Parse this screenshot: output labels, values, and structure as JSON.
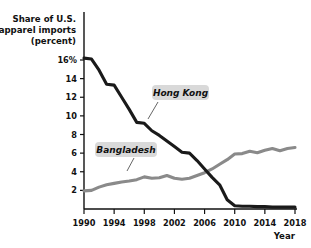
{
  "chart_data": {
    "type": "line",
    "title": "Share of U.S. apparel imports (percent)",
    "title_lines": [
      "Share of U.S.",
      "apparel imports",
      "(percent)"
    ],
    "xlabel": "Year",
    "ylabel": "Share of U.S. apparel imports (percent)",
    "xlim": [
      1990,
      2018
    ],
    "ylim": [
      0,
      16.8
    ],
    "grid": false,
    "legend_position": "inline-annotations",
    "x_ticks": [
      "1990",
      "1994",
      "1998",
      "2002",
      "2006",
      "2010",
      "2014",
      "2018"
    ],
    "x_tick_values": [
      1990,
      1994,
      1998,
      2002,
      2006,
      2010,
      2014,
      2018
    ],
    "y_ticks": [
      "2",
      "4",
      "6",
      "8",
      "10",
      "12",
      "14",
      "16%"
    ],
    "y_tick_values": [
      2,
      4,
      6,
      8,
      10,
      12,
      14,
      16
    ],
    "x": [
      1990,
      1991,
      1992,
      1993,
      1994,
      1995,
      1996,
      1997,
      1998,
      1999,
      2000,
      2001,
      2002,
      2003,
      2004,
      2005,
      2006,
      2007,
      2008,
      2009,
      2010,
      2011,
      2012,
      2013,
      2014,
      2015,
      2016,
      2017,
      2018
    ],
    "series": [
      {
        "name": "Hong Kong",
        "color": "#1a1a1a",
        "values": [
          16.2,
          16.1,
          14.9,
          13.4,
          13.3,
          12.0,
          10.7,
          9.3,
          9.2,
          8.4,
          7.9,
          7.3,
          6.7,
          6.1,
          6.0,
          5.2,
          4.3,
          3.4,
          2.6,
          1.0,
          0.35,
          0.3,
          0.3,
          0.25,
          0.25,
          0.2,
          0.2,
          0.2,
          0.2
        ]
      },
      {
        "name": "Bangladesh",
        "color": "#8a8a8a",
        "values": [
          1.95,
          2.0,
          2.35,
          2.6,
          2.75,
          2.9,
          3.0,
          3.15,
          3.45,
          3.3,
          3.35,
          3.6,
          3.3,
          3.2,
          3.3,
          3.6,
          3.9,
          4.3,
          4.8,
          5.3,
          5.9,
          5.95,
          6.2,
          6.05,
          6.3,
          6.5,
          6.25,
          6.5,
          6.6
        ]
      }
    ],
    "annotations": [
      {
        "label": "Hong Kong",
        "anchor_year": 2001,
        "anchor_value": 7.5
      },
      {
        "label": "Bangladesh",
        "anchor_year": 1998,
        "anchor_value": 3.45
      }
    ]
  },
  "axis": {
    "y_title_line1": "Share of U.S.",
    "y_title_line2": "apparel imports",
    "y_title_line3": "(percent)",
    "x_title": "Year"
  }
}
